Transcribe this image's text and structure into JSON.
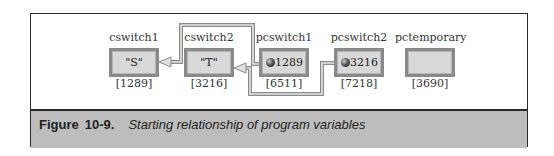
{
  "figure": {
    "label": "Figure",
    "number": "10-9.",
    "caption": "Starting relationship of program variables"
  },
  "variables": [
    {
      "name": "cswitch1",
      "value": "\"S\"",
      "address": "[1289]",
      "pointer": false
    },
    {
      "name": "cswitch2",
      "value": "\"T\"",
      "address": "[3216]",
      "pointer": false
    },
    {
      "name": "pcswitch1",
      "value": "1289",
      "address": "[6511]",
      "pointer": true,
      "points_to": "cswitch1"
    },
    {
      "name": "pcswitch2",
      "value": "3216",
      "address": "[7218]",
      "pointer": true,
      "points_to": "cswitch2"
    },
    {
      "name": "pctemporary",
      "value": "",
      "address": "[3690]",
      "pointer": false
    }
  ],
  "colors": {
    "frame_border": "#2a2a2a",
    "caption_band": "#bdbdbd",
    "box_fill": "#d9d9d9",
    "box_border": "#8a8a8a",
    "link_line": "#9a9a9a"
  }
}
